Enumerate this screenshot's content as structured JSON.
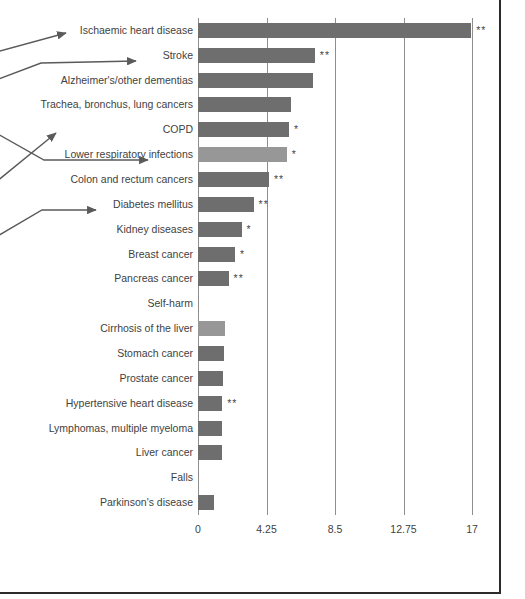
{
  "chart_data": {
    "type": "bar",
    "orientation": "horizontal",
    "title": "",
    "subtitle": "",
    "xlabel": "",
    "ylabel": "",
    "xlim": [
      0,
      17.5
    ],
    "grid": true,
    "legend": false,
    "xticks": [
      "0",
      "4.25",
      "8.5",
      "12.75",
      "17"
    ],
    "xtick_values": [
      0,
      4.25,
      8.5,
      12.75,
      17
    ],
    "categories": [
      "Ischaemic heart disease",
      "Stroke",
      "Alzheimer's/other dementias",
      "Trachea, bronchus, lung cancers",
      "COPD",
      "Lower respiratory infections",
      "Colon and rectum cancers",
      "Diabetes mellitus",
      "Kidney diseases",
      "Breast cancer",
      "Pancreas cancer",
      "Self-harm",
      "Cirrhosis of the liver",
      "Stomach cancer",
      "Prostate cancer",
      "Hypertensive heart disease",
      "Lymphomas, multiple myeloma",
      "Liver cancer",
      "Falls",
      "Parkinson's disease"
    ],
    "values": [
      16.95,
      7.25,
      7.15,
      5.75,
      5.65,
      5.5,
      4.4,
      3.45,
      2.7,
      2.3,
      1.9,
      0,
      1.65,
      1.6,
      1.55,
      1.5,
      1.5,
      1.5,
      0,
      1.0
    ],
    "significance": [
      "**",
      "**",
      "",
      "",
      "*",
      "*",
      "**",
      "**",
      "*",
      "*",
      "**",
      "",
      "",
      "",
      "",
      "**",
      "",
      "",
      "",
      ""
    ],
    "bar_shades": [
      "dark",
      "dark",
      "dark",
      "dark",
      "dark",
      "light",
      "dark",
      "dark",
      "dark",
      "dark",
      "dark",
      "none",
      "light",
      "dark",
      "dark",
      "dark",
      "dark",
      "dark",
      "none",
      "dark"
    ],
    "colors": {
      "bar_dark": "#6e6e6e",
      "bar_light": "#979797",
      "gridline": "#8e8e8e",
      "text": "#3f3f3f",
      "frame": "#2b2b2b",
      "annotation_arrow": "#5a5a5a"
    },
    "annotations": [
      {
        "target": "Ischaemic heart disease"
      },
      {
        "target": "Stroke"
      },
      {
        "target": "COPD"
      },
      {
        "target": "Lower respiratory infections"
      },
      {
        "target": "Diabetes mellitus"
      }
    ]
  }
}
